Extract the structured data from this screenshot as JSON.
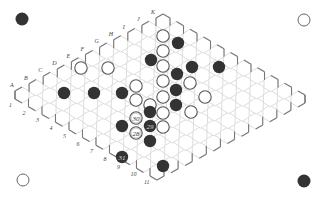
{
  "board": {
    "size": 11,
    "origin": [
      22,
      95
    ],
    "letter_step": [
      14.1,
      -7.3
    ],
    "row_step": [
      13.5,
      7.7
    ],
    "hex_radius": 8.1,
    "letters": [
      "A",
      "B",
      "C",
      "D",
      "E",
      "F",
      "G",
      "H",
      "I",
      "J",
      "K"
    ],
    "numbers": [
      "1",
      "2",
      "3",
      "4",
      "5",
      "6",
      "7",
      "8",
      "9",
      "10",
      "11"
    ],
    "colors": {
      "grid": "#d4d4d4",
      "edge": "#777777",
      "black": "#333333",
      "white_fill": "#ffffff",
      "white_stroke": "#555555"
    }
  },
  "corner_markers": [
    {
      "name": "top-left-black-marker",
      "color": "black",
      "x": 22,
      "y": 19
    },
    {
      "name": "top-right-white-marker",
      "color": "white",
      "x": 304,
      "y": 20
    },
    {
      "name": "bottom-left-white-marker",
      "color": "white",
      "x": 23,
      "y": 180
    },
    {
      "name": "bottom-right-black-marker",
      "color": "black",
      "x": 304,
      "y": 181
    }
  ],
  "stones": [
    {
      "color": "white",
      "x": 81,
      "y": 68
    },
    {
      "color": "white",
      "x": 108,
      "y": 68
    },
    {
      "color": "black",
      "x": 151,
      "y": 60
    },
    {
      "color": "white",
      "x": 163,
      "y": 36
    },
    {
      "color": "white",
      "x": 163,
      "y": 51
    },
    {
      "color": "black",
      "x": 178,
      "y": 43
    },
    {
      "color": "black",
      "x": 64,
      "y": 93
    },
    {
      "color": "black",
      "x": 94,
      "y": 93
    },
    {
      "color": "black",
      "x": 122,
      "y": 93
    },
    {
      "color": "white",
      "x": 136,
      "y": 86
    },
    {
      "color": "white",
      "x": 136,
      "y": 100
    },
    {
      "color": "white",
      "x": 163,
      "y": 66
    },
    {
      "color": "black",
      "x": 177,
      "y": 74
    },
    {
      "color": "white",
      "x": 163,
      "y": 81
    },
    {
      "color": "black",
      "x": 176,
      "y": 90
    },
    {
      "color": "white",
      "x": 190,
      "y": 83
    },
    {
      "color": "black",
      "x": 192,
      "y": 67
    },
    {
      "color": "black",
      "x": 219,
      "y": 67
    },
    {
      "color": "black",
      "x": 176,
      "y": 105
    },
    {
      "color": "white",
      "x": 163,
      "y": 97
    },
    {
      "color": "white",
      "x": 150,
      "y": 105
    },
    {
      "color": "white",
      "x": 205,
      "y": 97
    },
    {
      "color": "white",
      "x": 191,
      "y": 112
    },
    {
      "color": "white",
      "x": 163,
      "y": 113
    },
    {
      "color": "black",
      "x": 150,
      "y": 112
    },
    {
      "color": "white",
      "x": 136,
      "y": 118,
      "label": "30"
    },
    {
      "color": "black",
      "x": 122,
      "y": 126
    },
    {
      "color": "black",
      "x": 150,
      "y": 126,
      "label": "29"
    },
    {
      "color": "white",
      "x": 136,
      "y": 133,
      "label": "28"
    },
    {
      "color": "white",
      "x": 163,
      "y": 127
    },
    {
      "color": "black",
      "x": 150,
      "y": 141
    },
    {
      "color": "black",
      "x": 122,
      "y": 157,
      "label": "31"
    },
    {
      "color": "black",
      "x": 163,
      "y": 166
    }
  ]
}
